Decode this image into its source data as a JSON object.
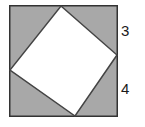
{
  "figure": {
    "canvas": {
      "width": 145,
      "height": 127
    },
    "outer_square": {
      "name": "outer-square",
      "x": 9,
      "y": 5,
      "width": 109,
      "height": 112,
      "fill_color": "#a8a8a8",
      "stroke_color": "#333333",
      "stroke_width": 1.5
    },
    "inner_square": {
      "name": "inner-square-tilted",
      "fill_color": "#ffffff",
      "stroke_color": "#444444",
      "stroke_width": 1.5,
      "points": "61,6 117,55 75,116 10,70",
      "vertices": [
        {
          "label": "top",
          "x": 61,
          "y": 6
        },
        {
          "label": "right",
          "x": 117,
          "y": 55
        },
        {
          "label": "bottom",
          "x": 75,
          "y": 116
        },
        {
          "label": "left",
          "x": 10,
          "y": 70
        }
      ]
    },
    "labels": {
      "top_right_segment": "3",
      "bottom_right_segment": "4"
    }
  }
}
